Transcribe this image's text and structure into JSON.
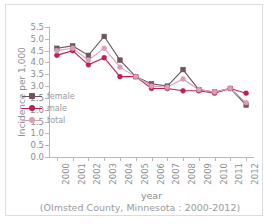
{
  "chart_data": {
    "type": "line",
    "title": "",
    "subtitle": "",
    "xlabel": "year",
    "ylabel": "Incidence per 1,000",
    "caption": "(Olmsted County, Minnesota : 2000-2012)",
    "categories": [
      "2000",
      "2001",
      "2002",
      "2003",
      "2004",
      "2005",
      "2006",
      "2007",
      "2008",
      "2009",
      "2010",
      "2011",
      "2012"
    ],
    "ylim": [
      0.0,
      5.5
    ],
    "ytick_labels": [
      "5.5",
      "5.0",
      "4.5",
      "4.0",
      "3.5",
      "3.0",
      "2.5",
      "2.0",
      "1.5",
      "1.0",
      "0.5",
      "0.0"
    ],
    "ytick_values": [
      5.5,
      5.0,
      4.5,
      4.0,
      3.5,
      3.0,
      2.5,
      2.0,
      1.5,
      1.0,
      0.5,
      0.0
    ],
    "grid": false,
    "legend_position": "inside-lower-left",
    "series": [
      {
        "name": "female",
        "color": "#6d5560",
        "marker": "square",
        "values": [
          4.6,
          4.7,
          4.3,
          5.1,
          4.1,
          3.4,
          3.1,
          3.0,
          3.7,
          2.85,
          2.75,
          2.9,
          2.2
        ]
      },
      {
        "name": "male",
        "color": "#c01f54",
        "marker": "circle",
        "values": [
          4.3,
          4.5,
          3.9,
          4.2,
          3.4,
          3.4,
          2.9,
          2.9,
          2.8,
          2.8,
          2.7,
          2.9,
          2.7
        ]
      },
      {
        "name": "total",
        "color": "#d9a0ad",
        "marker": "circle",
        "values": [
          4.5,
          4.6,
          4.1,
          4.6,
          3.8,
          3.4,
          3.0,
          2.95,
          3.3,
          2.85,
          2.75,
          2.9,
          2.3
        ]
      }
    ]
  },
  "axis": {
    "line_color": "#b9b9b9",
    "tick_text_color": "#8d8d8d"
  },
  "legend": {
    "items": [
      {
        "label": "female"
      },
      {
        "label": "male"
      },
      {
        "label": "total"
      }
    ]
  }
}
